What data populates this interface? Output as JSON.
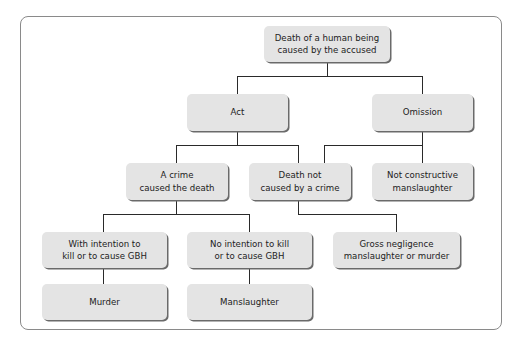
{
  "diagram": {
    "nodes": {
      "root": "Death of a human being\ncaused by the accused",
      "act": "Act",
      "omission": "Omission",
      "crime": "A crime\ncaused the death",
      "not_crime": "Death not\ncaused by a crime",
      "not_constructive": "Not constructive\nmanslaughter",
      "intention": "With intention to\nkill or to cause GBH",
      "no_intention": "No intention to kill\nor to cause GBH",
      "gross": "Gross negligence\nmanslaughter or murder",
      "murder": "Murder",
      "manslaughter": "Manslaughter"
    },
    "colors": {
      "box": "#e4e4e4",
      "shadow": "#6a6a6a",
      "line": "#2a2a2a",
      "frame": "#8a8a8a"
    }
  }
}
